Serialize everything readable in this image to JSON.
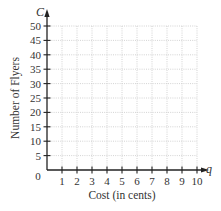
{
  "chart_data": {
    "type": "line",
    "title": "",
    "xlabel": "Cost (in cents)",
    "ylabel": "Number of Flyers",
    "x_var": "q",
    "y_var": "C",
    "origin_label": "0",
    "xlim": [
      0,
      10
    ],
    "ylim": [
      0,
      50
    ],
    "x_ticks": [
      1,
      2,
      3,
      4,
      5,
      6,
      7,
      8,
      9,
      10
    ],
    "y_ticks": [
      5,
      10,
      15,
      20,
      25,
      30,
      35,
      40,
      45,
      50
    ],
    "grid": true,
    "grid_style": "dotted",
    "series": [],
    "legend": null
  },
  "colors": {
    "axis": "#222222",
    "grid": "#c8c8c8",
    "text": "#333333"
  }
}
